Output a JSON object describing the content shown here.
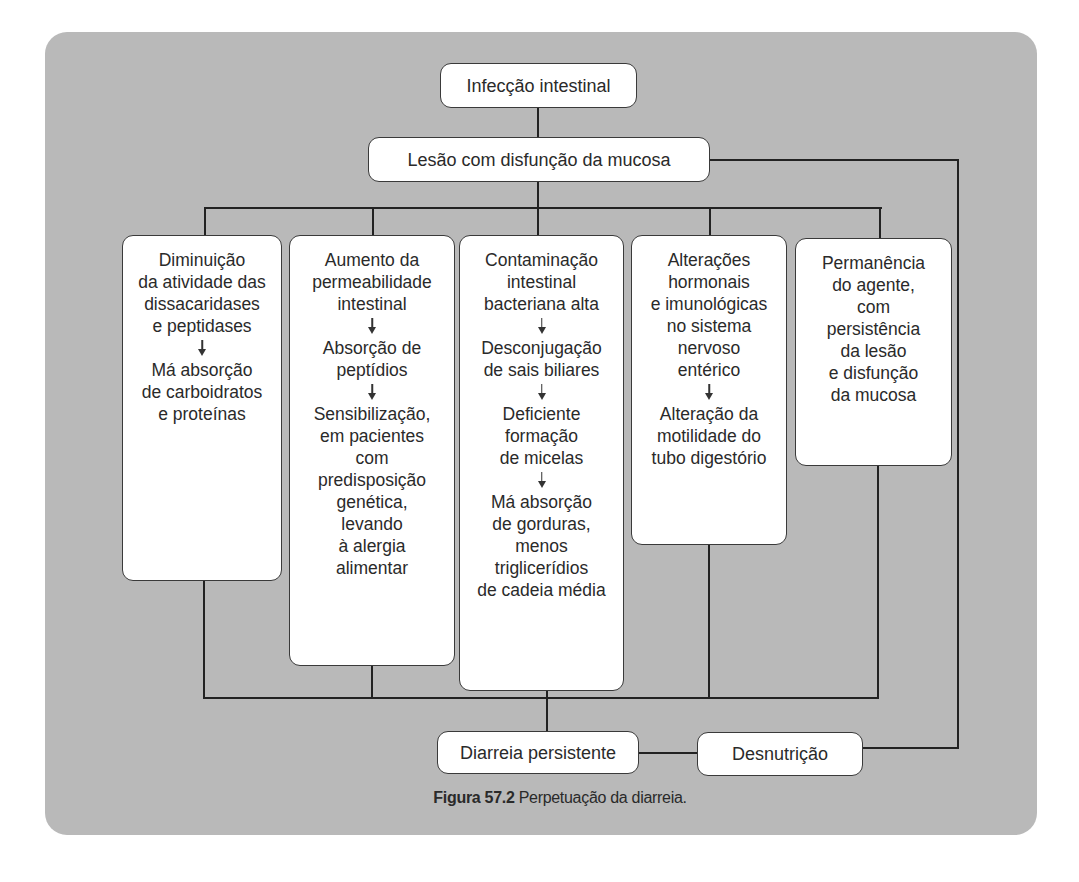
{
  "figure": {
    "background_color": "#b9b9b9",
    "box_color": "#ffffff",
    "line_color": "#222222",
    "caption": {
      "label": "Figura 57.2",
      "text": "Perpetuação da diarreia."
    }
  },
  "nodes": {
    "root": "Infecção intestinal",
    "lesion": "Lesão com disfunção da mucosa",
    "diarrhea": "Diarreia persistente",
    "malnutrition": "Desnutrição"
  },
  "columns": [
    {
      "steps": [
        [
          "Diminuição",
          "da atividade das",
          "dissacaridases",
          "e peptidases"
        ],
        [
          "Má absorção",
          "de carboidratos",
          "e proteínas"
        ]
      ]
    },
    {
      "steps": [
        [
          "Aumento da",
          "permeabilidade",
          "intestinal"
        ],
        [
          "Absorção de",
          "peptídios"
        ],
        [
          "Sensibilização,",
          "em pacientes",
          "com",
          "predisposição",
          "genética,",
          "levando",
          "à alergia",
          "alimentar"
        ]
      ]
    },
    {
      "steps": [
        [
          "Contaminação",
          "intestinal",
          "bacteriana alta"
        ],
        [
          "Desconjugação",
          "de sais biliares"
        ],
        [
          "Deficiente",
          "formação",
          "de micelas"
        ],
        [
          "Má absorção",
          "de gorduras,",
          "menos",
          "triglicerídios",
          "de cadeia média"
        ]
      ]
    },
    {
      "steps": [
        [
          "Alterações",
          "hormonais",
          "e imunológicas",
          "no sistema",
          "nervoso",
          "entérico"
        ],
        [
          "Alteração da",
          "motilidade do",
          "tubo digestório"
        ]
      ]
    },
    {
      "steps": [
        [
          "Permanência",
          "do agente,",
          "com",
          "persistência",
          "da lesão",
          "e disfunção",
          "da mucosa"
        ]
      ]
    }
  ],
  "edges": [
    [
      "Infecção intestinal",
      "Lesão com disfunção da mucosa"
    ],
    [
      "Lesão com disfunção da mucosa",
      "column-1"
    ],
    [
      "Lesão com disfunção da mucosa",
      "column-2"
    ],
    [
      "Lesão com disfunção da mucosa",
      "column-3"
    ],
    [
      "Lesão com disfunção da mucosa",
      "column-4"
    ],
    [
      "Lesão com disfunção da mucosa",
      "column-5"
    ],
    [
      "columns",
      "Diarreia persistente"
    ],
    [
      "Diarreia persistente",
      "Desnutrição"
    ],
    [
      "Desnutrição",
      "Lesão com disfunção da mucosa"
    ]
  ]
}
